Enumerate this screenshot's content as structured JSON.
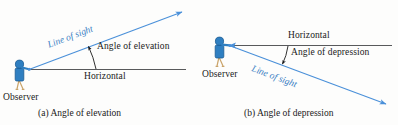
{
  "figure": {
    "background_color": "#fdfdfc",
    "colors": {
      "line_of_sight": "#4a90d9",
      "line_of_sight_text": "#3b7fc4",
      "horizontal_line": "#58595b",
      "observer_body": "#2f7fc1",
      "observer_outline": "#1a5a92",
      "observer_legs": "#caa46a",
      "text": "#1a1a1a"
    }
  },
  "panels": [
    {
      "id": "panel-a",
      "caption": "(a) Angle of elevation",
      "labels": {
        "line_of_sight": "Line of sight",
        "angle": "Angle of elevation",
        "horizontal": "Horizontal",
        "observer": "Observer"
      }
    },
    {
      "id": "panel-b",
      "caption": "(b) Angle of depression",
      "labels": {
        "line_of_sight": "Line of sight",
        "angle": "Angle of depression",
        "horizontal": "Horizontal",
        "observer": "Observer"
      }
    }
  ]
}
